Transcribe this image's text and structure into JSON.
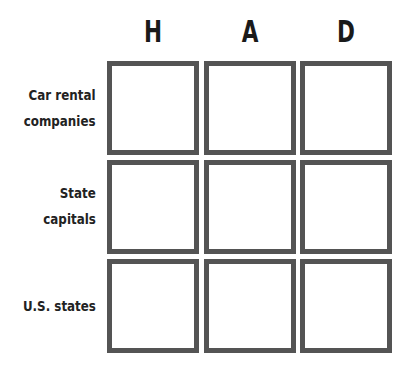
{
  "grid": {
    "columns": [
      {
        "label": "H"
      },
      {
        "label": "A"
      },
      {
        "label": "D"
      }
    ],
    "rows": [
      {
        "label_line1": "Car rental",
        "label_line2": "companies"
      },
      {
        "label_line1": "State",
        "label_line2": "capitals"
      },
      {
        "label_line1": "U.S. states",
        "label_line2": ""
      }
    ],
    "cells": [
      [
        "",
        "",
        ""
      ],
      [
        "",
        "",
        ""
      ],
      [
        "",
        "",
        ""
      ]
    ],
    "border_color": "#545454"
  }
}
